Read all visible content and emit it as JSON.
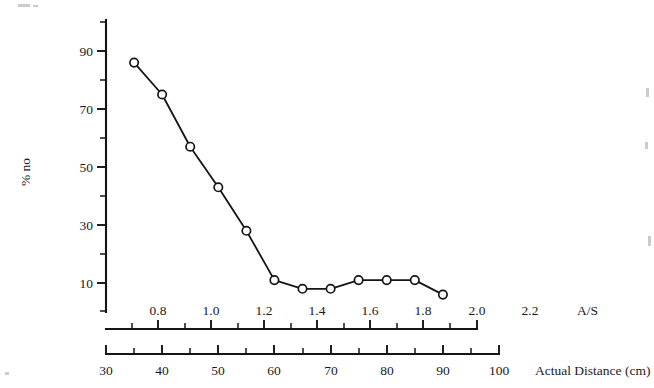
{
  "figure": {
    "name": "percent-no-vs-actual-distance-plot",
    "background_color": "#ffffff",
    "ink_color": "#151515"
  },
  "chart_data": {
    "type": "line",
    "title": "",
    "subtitle": "",
    "xlabel": "Actual Distance (cm)",
    "ylabel": "% no",
    "secondary_xlabel": "A/S",
    "xlim": [
      30,
      100
    ],
    "ylim": [
      0,
      100
    ],
    "grid": false,
    "legend": "none",
    "marker": "open-circle",
    "x": [
      35,
      40,
      45,
      50,
      55,
      60,
      65,
      70,
      75,
      80,
      85,
      90
    ],
    "values": [
      86,
      75,
      57,
      43,
      28,
      11,
      8,
      8,
      11,
      11,
      11,
      6
    ],
    "series": [
      {
        "name": "% no",
        "x": [
          35,
          40,
          45,
          50,
          55,
          60,
          65,
          70,
          75,
          80,
          85,
          90
        ],
        "values": [
          86,
          75,
          57,
          43,
          28,
          11,
          8,
          8,
          11,
          11,
          11,
          6
        ]
      }
    ],
    "y_axis": {
      "major_ticks": [
        10,
        30,
        50,
        70,
        90
      ],
      "major_tick_labels": [
        "10",
        "30",
        "50",
        "70",
        "90"
      ],
      "minor_ticks": [
        0,
        20,
        40,
        60,
        80,
        100
      ]
    },
    "x_axis_bottom": {
      "label": "Actual Distance (cm)",
      "major_ticks": [
        30,
        40,
        50,
        60,
        70,
        80,
        90,
        100
      ],
      "major_tick_labels": [
        "30",
        "40",
        "50",
        "60",
        "70",
        "80",
        "90",
        "100"
      ],
      "minor_ticks": [
        35,
        45,
        55,
        65,
        75,
        85,
        95
      ]
    },
    "x_axis_top": {
      "label": "A/S",
      "major_ticks": [
        0.8,
        1.0,
        1.2,
        1.4,
        1.6,
        1.8,
        2.0,
        2.2
      ],
      "major_tick_labels": [
        "0.8",
        "1.0",
        "1.2",
        "1.4",
        "1.6",
        "1.8",
        "2.0",
        "2.2"
      ],
      "minor_ticks": [
        0.9,
        1.1,
        1.3,
        1.5,
        1.7,
        1.9,
        2.1
      ],
      "distance_at_first_major": 38,
      "distance_per_unit": 28.5
    }
  }
}
